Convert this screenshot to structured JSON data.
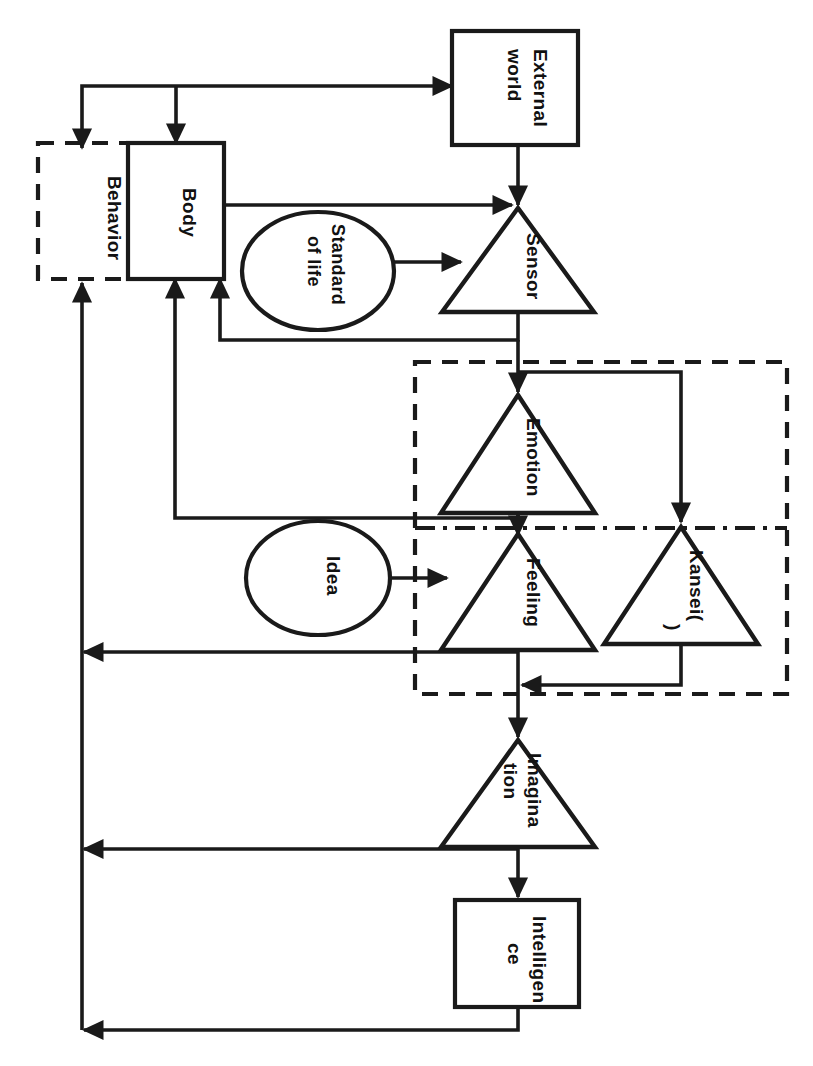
{
  "diagram": {
    "orientation": "rotated-90",
    "stroke_color": "#1a1a1a",
    "background_color": "#ffffff",
    "nodes": {
      "external_world": {
        "label_line1": "External",
        "label_line2": "world",
        "shape": "rectangle"
      },
      "behavior": {
        "label": "Behavior",
        "shape": "dashed-rectangle"
      },
      "body": {
        "label": "Body",
        "shape": "rectangle"
      },
      "standard_of_life": {
        "label_line1": "Standard",
        "label_line2": "of life",
        "shape": "ellipse"
      },
      "idea": {
        "label": "Idea",
        "shape": "ellipse"
      },
      "sensor": {
        "label": "Sensor",
        "shape": "triangle"
      },
      "emotion": {
        "label": "Emotion",
        "shape": "triangle"
      },
      "feeling": {
        "label": "Feeling",
        "shape": "triangle"
      },
      "kansei": {
        "label_line1": "Kansei(",
        "label_line2": ")",
        "label_full": "Kansei(*)",
        "shape": "triangle"
      },
      "imagination": {
        "label_line1": "Imagina",
        "label_line2": "tion",
        "label_full": "Imagination",
        "shape": "triangle"
      },
      "intelligence": {
        "label_line1": "Intelligen",
        "label_line2": "ce",
        "label_full": "Intelligence",
        "shape": "rectangle"
      }
    },
    "groups": {
      "kansei_region": {
        "style": "dashed"
      },
      "inner_divider": {
        "style": "dash-dot"
      }
    },
    "edges": [
      {
        "from": "body",
        "to": "external_world"
      },
      {
        "from": "behavior",
        "to": "external_world"
      },
      {
        "from": "external_world",
        "to": "sensor"
      },
      {
        "from": "body",
        "to": "sensor"
      },
      {
        "from": "standard_of_life",
        "to": "sensor"
      },
      {
        "from": "sensor",
        "to": "body"
      },
      {
        "from": "sensor",
        "to": "emotion"
      },
      {
        "from": "sensor",
        "to": "kansei"
      },
      {
        "from": "emotion",
        "to": "body"
      },
      {
        "from": "emotion",
        "to": "feeling"
      },
      {
        "from": "idea",
        "to": "feeling"
      },
      {
        "from": "feeling",
        "to": "behavior"
      },
      {
        "from": "kansei",
        "to": "feeling"
      },
      {
        "from": "feeling",
        "to": "imagination"
      },
      {
        "from": "imagination",
        "to": "behavior"
      },
      {
        "from": "imagination",
        "to": "intelligence"
      },
      {
        "from": "intelligence",
        "to": "behavior"
      }
    ]
  }
}
